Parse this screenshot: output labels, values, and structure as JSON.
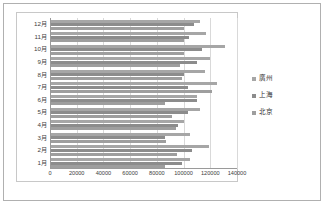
{
  "chart_data": {
    "type": "bar",
    "orientation": "horizontal",
    "title": "",
    "xlabel": "",
    "ylabel": "",
    "xlim": [
      0,
      140000
    ],
    "xticks": [
      0,
      20000,
      40000,
      60000,
      80000,
      100000,
      120000,
      140000
    ],
    "xtick_labels": [
      "0",
      "20000",
      "40000",
      "60000",
      "80000",
      "100000",
      "120000",
      "140000"
    ],
    "grid": true,
    "legend_position": "right",
    "categories": [
      "1月",
      "2月",
      "3月",
      "4月",
      "5月",
      "6月",
      "7月",
      "8月",
      "9月",
      "10月",
      "11月",
      "12月"
    ],
    "series": [
      {
        "name": "廣州",
        "color": "#a6a6a6",
        "values": [
          105000,
          119000,
          105000,
          100000,
          112000,
          110000,
          125000,
          116000,
          120000,
          131000,
          117000,
          112000
        ]
      },
      {
        "name": "上海",
        "color": "#8c8c8c",
        "values": [
          99000,
          106000,
          86000,
          96000,
          103000,
          110000,
          103000,
          100000,
          110000,
          114000,
          104000,
          108000
        ]
      },
      {
        "name": "北京",
        "color": "#9e9e9e",
        "values": [
          86000,
          95000,
          87000,
          94000,
          91000,
          86000,
          121000,
          99000,
          97000,
          100000,
          100000,
          100000
        ]
      }
    ]
  },
  "legend": {
    "items": [
      {
        "label": "廣州"
      },
      {
        "label": "上海"
      },
      {
        "label": "北京"
      }
    ]
  }
}
